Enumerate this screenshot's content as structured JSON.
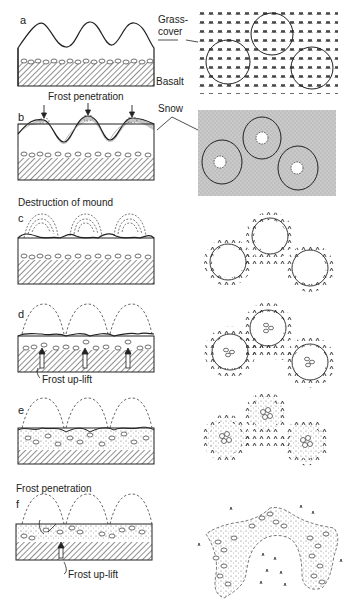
{
  "figure": {
    "panels": [
      {
        "letter": "a",
        "title": ""
      },
      {
        "letter": "b",
        "title": "Frost penetration"
      },
      {
        "letter": "c",
        "title": "Destruction of mound"
      },
      {
        "letter": "d",
        "title": ""
      },
      {
        "letter": "e",
        "title": ""
      },
      {
        "letter": "f",
        "title": "Frost penetration"
      }
    ],
    "annotations": {
      "grass_cover_1": "Grass-",
      "grass_cover_2": "cover",
      "basalt": "Basalt",
      "snow": "Snow",
      "frost_uplift_d": "Frost up-lift",
      "frost_uplift_f": "Frost up-lift"
    },
    "colors": {
      "ink": "#222222",
      "snow_fill": "#c8c8c8",
      "hatch": "#444444",
      "background": "#ffffff"
    }
  }
}
